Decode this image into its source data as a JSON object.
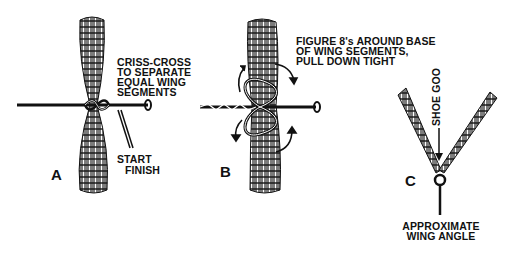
{
  "figure": {
    "panels": [
      {
        "id": "A",
        "letter": "A",
        "callout_lines": [
          "CRISS-CROSS",
          "TO SEPARATE",
          "EQUAL WING",
          "SEGMENTS"
        ],
        "thread_labels": [
          "START",
          "FINISH"
        ]
      },
      {
        "id": "B",
        "letter": "B",
        "callout_lines": [
          "FIGURE 8's AROUND BASE",
          "OF WING SEGMENTS,",
          "PULL DOWN TIGHT"
        ]
      },
      {
        "id": "C",
        "letter": "C",
        "arrow_label": "SHOE GOO",
        "caption_lines": [
          "APPROXIMATE",
          "WING ANGLE"
        ]
      }
    ],
    "colors": {
      "ink": "#111111",
      "background": "#ffffff"
    }
  }
}
